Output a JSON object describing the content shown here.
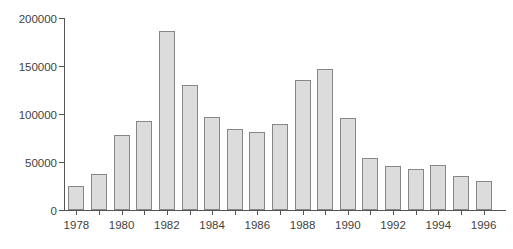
{
  "chart_data": {
    "type": "bar",
    "title": "",
    "xlabel": "",
    "ylabel": "",
    "categories": [
      "1978",
      "1979",
      "1980",
      "1981",
      "1982",
      "1983",
      "1984",
      "1985",
      "1986",
      "1987",
      "1988",
      "1989",
      "1990",
      "1991",
      "1992",
      "1993",
      "1994",
      "1995",
      "1996"
    ],
    "values": [
      25000,
      38000,
      78000,
      93000,
      187000,
      130000,
      97000,
      84000,
      81000,
      90000,
      136000,
      147000,
      96000,
      54000,
      46000,
      43000,
      47000,
      35000,
      30000
    ],
    "ylim": [
      0,
      200000
    ],
    "yticks": [
      0,
      50000,
      100000,
      150000,
      200000
    ],
    "ytick_labels": [
      "0",
      "50000",
      "100000",
      "150000",
      "200000"
    ],
    "xtick_labels_shown": [
      "1978",
      "1980",
      "1982",
      "1984",
      "1986",
      "1988",
      "1990",
      "1992",
      "1994",
      "1996"
    ],
    "grid": false,
    "legend": "none",
    "colors": {
      "background": "#ffffff",
      "bar_fill": "#dcdcdc",
      "bar_dot": "#c3c3c3",
      "bar_border": "#878787",
      "axis": "#555555",
      "text": "#3f3f3f"
    }
  }
}
